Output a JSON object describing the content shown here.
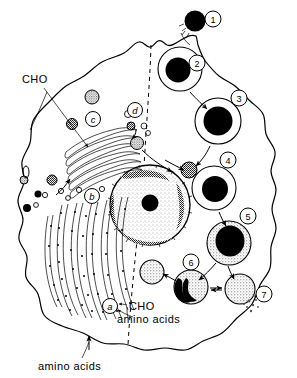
{
  "figure": {
    "colors": {
      "ink": "#000000",
      "background": "#ffffff",
      "stipple": "#8a8a8a"
    }
  },
  "labels": {
    "cho_top": "CHO",
    "cho_bottom": "CHO",
    "amino_acids_mid": "amino acids",
    "amino_acids_bottom": "amino acids"
  },
  "organelle_letters": [
    {
      "id": "a",
      "label": "a",
      "cx": 110,
      "cy": 306,
      "meaning": "plasma-membrane-uptake-site"
    },
    {
      "id": "b",
      "label": "b",
      "cx": 92,
      "cy": 196,
      "meaning": "rough-endoplasmic-reticulum"
    },
    {
      "id": "c",
      "label": "c",
      "cx": 93,
      "cy": 119,
      "meaning": "golgi-apparatus"
    },
    {
      "id": "d",
      "label": "d",
      "cx": 135,
      "cy": 110,
      "meaning": "transport-vesicles"
    }
  ],
  "stages": [
    {
      "id": "1",
      "label": "1",
      "cx": 213,
      "cy": 19,
      "meaning": "particle-binding-at-cell-surface"
    },
    {
      "id": "2",
      "label": "2",
      "cx": 199,
      "cy": 65,
      "meaning": "phagosome-formation"
    },
    {
      "id": "3",
      "label": "3",
      "cx": 238,
      "cy": 98,
      "meaning": "phagosome-internalized"
    },
    {
      "id": "4",
      "label": "4",
      "cx": 228,
      "cy": 158,
      "meaning": "lysosome-fusion"
    },
    {
      "id": "5",
      "label": "5",
      "cx": 248,
      "cy": 216,
      "meaning": "phagolysosome-digestion"
    },
    {
      "id": "6",
      "label": "6",
      "cx": 191,
      "cy": 262,
      "meaning": "residual-body"
    },
    {
      "id": "7",
      "label": "7",
      "cx": 264,
      "cy": 294,
      "meaning": "exocytosis-of-residue"
    }
  ],
  "organelles": {
    "nucleus": {
      "cx": 150,
      "cy": 205,
      "r": 40,
      "nucleolus_r": 8
    },
    "golgi_stacks": 6,
    "er_strands": 11,
    "lysosomes_count": 6
  }
}
